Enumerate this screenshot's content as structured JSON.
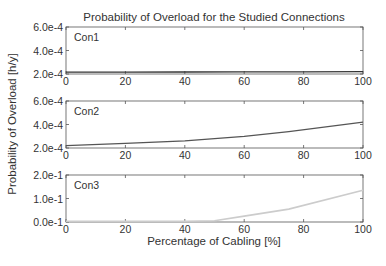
{
  "chart_data": {
    "type": "line",
    "title": "Probability of Overload for the Studied Connections",
    "xlabel": "Percentage of Cabling [%]",
    "ylabel": "Probability of Overload [h/y]",
    "xlim": [
      0,
      100
    ],
    "xticks": [
      "0",
      "20",
      "40",
      "60",
      "80",
      "100"
    ],
    "grid": false,
    "legend_position": "none",
    "panels": [
      {
        "label": "Con1",
        "ylim": [
          0.0002,
          0.0006
        ],
        "yticks": [
          "6.0e-4",
          "4.0e-4",
          "2.0e-4"
        ],
        "color": "#333333",
        "x": [
          0,
          20,
          40,
          60,
          80,
          100
        ],
        "values": [
          0.000215,
          0.000216,
          0.000217,
          0.000218,
          0.000219,
          0.00022
        ]
      },
      {
        "label": "Con2",
        "ylim": [
          0.0002,
          0.0006
        ],
        "yticks": [
          "6.0e-4",
          "4.0e-4",
          "2.0e-4"
        ],
        "color": "#555555",
        "x": [
          0,
          20,
          40,
          50,
          60,
          75,
          100
        ],
        "values": [
          0.00022,
          0.00024,
          0.00026,
          0.00028,
          0.0003,
          0.00034,
          0.00042
        ]
      },
      {
        "label": "Con3",
        "ylim": [
          0.0,
          0.2
        ],
        "yticks": [
          "2.0e-1",
          "1.0e-1",
          "0.0e-1"
        ],
        "color": "#cccccc",
        "x": [
          0,
          20,
          40,
          50,
          60,
          75,
          100
        ],
        "values": [
          0.0,
          0.0,
          0.002,
          0.005,
          0.025,
          0.055,
          0.135
        ]
      }
    ]
  }
}
